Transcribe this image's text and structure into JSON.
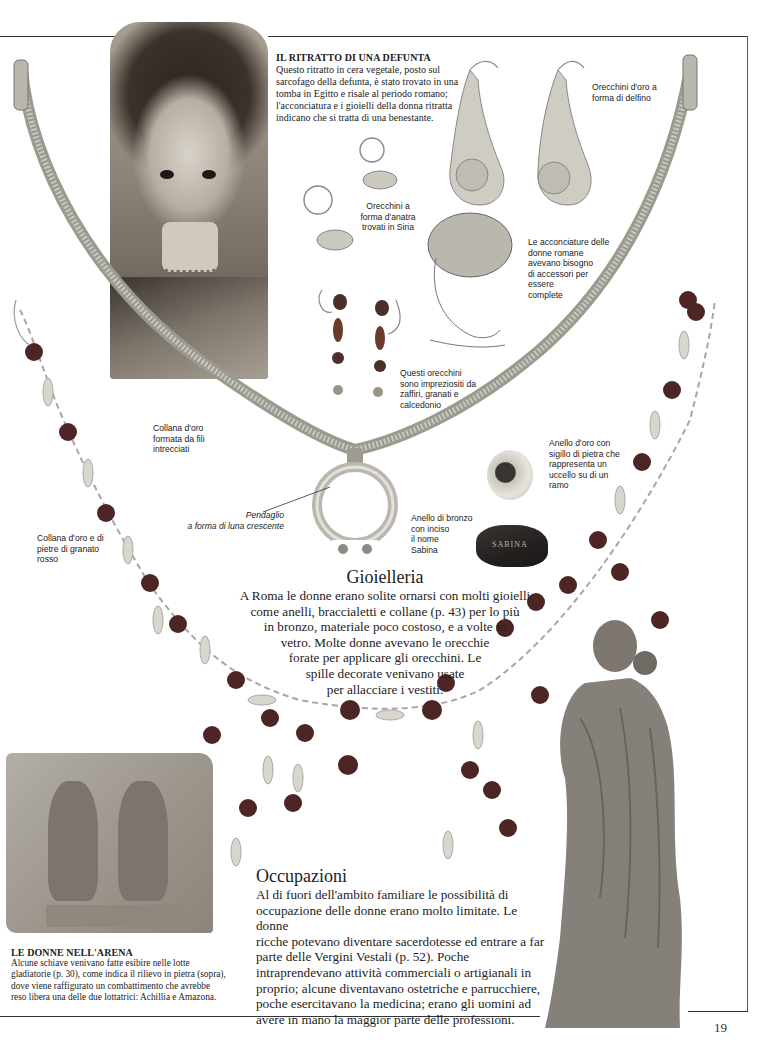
{
  "page": {
    "number": "19"
  },
  "portrait_caption": {
    "title": "IL RITRATTO DI UNA DEFUNTA",
    "lines": [
      "Questo ritratto in cera vegetale, posto sul",
      "sarcofago della defunta, è stato trovato in una",
      "tomba in Egitto e risale al periodo romano;",
      "l'acconciatura e i gioielli della donna ritratta",
      "indicano che si tratta di una benestante."
    ]
  },
  "labels": {
    "dolphin_earrings": [
      "Orecchini d'oro a",
      "forma di delfino"
    ],
    "duck_earrings": [
      "Orecchini a",
      "forma d'anatra",
      "trovati in Siria"
    ],
    "hairstyles": [
      "Le acconciature delle",
      "donne romane",
      "avevano bisogno",
      "di accessori per",
      "essere",
      "complete"
    ],
    "gem_earrings": [
      "Questi orecchini",
      "sono impreziositi da",
      "zaffiri, granati e",
      "calcedonio"
    ],
    "gold_necklace": [
      "Collana d'oro",
      "formata da fili",
      "intrecciati"
    ],
    "pendant": [
      "Pendaglio",
      "a forma di luna crescente"
    ],
    "gold_ring": [
      "Anello d'oro con",
      "sigillo di pietra che",
      "rappresenta un",
      "uccello su di un",
      "ramo"
    ],
    "bronze_ring": [
      "Anello di bronzo",
      "con inciso",
      "il nome",
      "Sabina"
    ],
    "garnet_necklace": [
      "Collana d'oro e di",
      "pietre di granato",
      "rosso"
    ]
  },
  "bronze_ring_engraving": "SABINA",
  "gioielleria": {
    "heading": "Gioielleria",
    "lines": [
      "A Roma le donne erano solite ornarsi con molti gioielli",
      "come anelli, braccialetti e collane (p. 43) per lo più",
      "in bronzo, materiale poco costoso, e a volte in",
      "vetro. Molte donne avevano le orecchie",
      "forate per applicare gli orecchini. Le",
      "spille decorate venivano usate",
      "per allacciare i vestiti."
    ]
  },
  "occupazioni": {
    "heading": "Occupazioni",
    "lines": [
      "Al di fuori dell'ambito familiare le possibilità di",
      "occupazione delle donne erano molto limitate. Le donne",
      "ricche potevano diventare sacerdotesse ed entrare a far",
      "parte delle Vergini Vestali (p. 52). Poche",
      "intraprendevano attività commerciali o artigianali in",
      "proprio; alcune diventavano ostetriche e parrucchiere,",
      "poche esercitavano la medicina; erano gli uomini ad",
      "avere in mano la maggior parte delle professioni."
    ]
  },
  "arena_caption": {
    "title": "LE DONNE NELL'ARENA",
    "lines": [
      "Alcune schiave venivano fatte esibire nelle lotte",
      "gladiatorie (p. 30), come indica il rilievo in pietra (sopra),",
      "dove viene raffigurato un combattimento che avrebbe",
      "reso libera una delle due lottatrici: Achillia e Amazona."
    ]
  },
  "relief_inscriptions": {
    "top": "ΑΠΕΛΥΘΗ",
    "bottom": "ΑΜΑΖΩΝ ΑΧΙΛΛΙΑ"
  },
  "colors": {
    "text": "#222222",
    "rule": "#333333",
    "garnet": "#5b2a2a",
    "gold_chain": "#a8a79c"
  }
}
